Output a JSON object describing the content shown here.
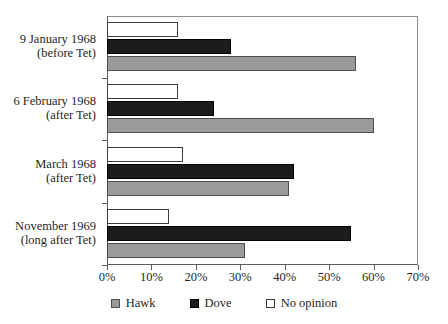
{
  "chart_data": {
    "type": "bar",
    "orientation": "horizontal",
    "title": "",
    "subtitle": "",
    "xlabel": "",
    "ylabel": "",
    "xlim": [
      0,
      70
    ],
    "xtick_labels": [
      "0%",
      "10%",
      "20%",
      "30%",
      "40%",
      "50%",
      "60%",
      "70%"
    ],
    "xtick_values": [
      0,
      10,
      20,
      30,
      40,
      50,
      60,
      70
    ],
    "grid": false,
    "legend_position": "bottom",
    "categories": [
      "9 January 1968\n(before Tet)",
      "6 February 1968\n(after Tet)",
      "March 1968\n(after Tet)",
      "November 1969\n(long after Tet)"
    ],
    "category_lines": [
      [
        "9 January 1968",
        "(before Tet)"
      ],
      [
        "6 February 1968",
        "(after Tet)"
      ],
      [
        "March 1968",
        "(after Tet)"
      ],
      [
        "November 1969",
        "(long after Tet)"
      ]
    ],
    "series": [
      {
        "name": "Hawk",
        "color": "#9a9a9a",
        "values": [
          56,
          60,
          41,
          31
        ]
      },
      {
        "name": "Dove",
        "color": "#1c1c1c",
        "values": [
          28,
          24,
          42,
          55
        ]
      },
      {
        "name": "No opinion",
        "color": "#ffffff",
        "values": [
          16,
          16,
          17,
          14
        ]
      }
    ]
  },
  "legend": {
    "items": [
      {
        "label": "Hawk",
        "swatch": "hawk"
      },
      {
        "label": "Dove",
        "swatch": "dove"
      },
      {
        "label": "No opinion",
        "swatch": "noop"
      }
    ]
  },
  "colors": {
    "hawk": "#9a9a9a",
    "dove": "#1c1c1c",
    "no_opinion": "#ffffff",
    "axis": "#5a5a5a",
    "background": "#ffffff"
  }
}
